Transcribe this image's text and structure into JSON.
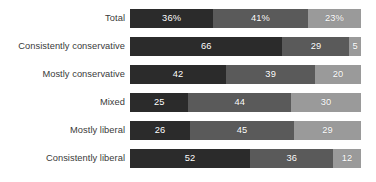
{
  "chart_data": {
    "type": "bar",
    "orientation": "horizontal",
    "stacked": true,
    "normalized": true,
    "title": "",
    "subtitle": "",
    "xlabel": "",
    "ylabel": "",
    "xlim": [
      0,
      100
    ],
    "grid": false,
    "legend": "none",
    "categories": [
      "Total",
      "Consistently conservative",
      "Mostly conservative",
      "Mixed",
      "Mostly liberal",
      "Consistently liberal"
    ],
    "series": [
      {
        "name": "segment-1",
        "color": "#2b2b2b",
        "values": [
          36,
          66,
          42,
          25,
          26,
          52
        ],
        "labels": [
          "36%",
          "66",
          "42",
          "25",
          "26",
          "52"
        ]
      },
      {
        "name": "segment-2",
        "color": "#5a5a5a",
        "values": [
          41,
          29,
          39,
          44,
          45,
          36
        ],
        "labels": [
          "41%",
          "29",
          "39",
          "44",
          "45",
          "36"
        ]
      },
      {
        "name": "segment-3",
        "color": "#9a9a9a",
        "values": [
          23,
          5,
          20,
          30,
          29,
          12
        ],
        "labels": [
          "23%",
          "5",
          "20",
          "30",
          "29",
          "12"
        ]
      }
    ]
  },
  "colors": {
    "background": "#ffffff",
    "label_text": "#3a3a3a",
    "value_text": "#ffffff",
    "segment_1": "#2b2b2b",
    "segment_2": "#5a5a5a",
    "segment_3": "#9a9a9a"
  },
  "rows": [
    {
      "label": "Total",
      "segments": [
        {
          "value": 36,
          "label": "36%",
          "color": "#2b2b2b"
        },
        {
          "value": 41,
          "label": "41%",
          "color": "#5a5a5a"
        },
        {
          "value": 23,
          "label": "23%",
          "color": "#9a9a9a"
        }
      ]
    },
    {
      "label": "Consistently conservative",
      "segments": [
        {
          "value": 66,
          "label": "66",
          "color": "#2b2b2b"
        },
        {
          "value": 29,
          "label": "29",
          "color": "#5a5a5a"
        },
        {
          "value": 5,
          "label": "5",
          "color": "#9a9a9a"
        }
      ]
    },
    {
      "label": "Mostly conservative",
      "segments": [
        {
          "value": 42,
          "label": "42",
          "color": "#2b2b2b"
        },
        {
          "value": 39,
          "label": "39",
          "color": "#5a5a5a"
        },
        {
          "value": 20,
          "label": "20",
          "color": "#9a9a9a"
        }
      ]
    },
    {
      "label": "Mixed",
      "segments": [
        {
          "value": 25,
          "label": "25",
          "color": "#2b2b2b"
        },
        {
          "value": 44,
          "label": "44",
          "color": "#5a5a5a"
        },
        {
          "value": 30,
          "label": "30",
          "color": "#9a9a9a"
        }
      ]
    },
    {
      "label": "Mostly liberal",
      "segments": [
        {
          "value": 26,
          "label": "26",
          "color": "#2b2b2b"
        },
        {
          "value": 45,
          "label": "45",
          "color": "#5a5a5a"
        },
        {
          "value": 29,
          "label": "29",
          "color": "#9a9a9a"
        }
      ]
    },
    {
      "label": "Consistently liberal",
      "segments": [
        {
          "value": 52,
          "label": "52",
          "color": "#2b2b2b"
        },
        {
          "value": 36,
          "label": "36",
          "color": "#5a5a5a"
        },
        {
          "value": 12,
          "label": "12",
          "color": "#9a9a9a"
        }
      ]
    }
  ],
  "layout": {
    "label_column_width": 130,
    "bar_track_width": 231,
    "bar_height": 19,
    "row_pitch": 28,
    "first_row_top": 9
  }
}
